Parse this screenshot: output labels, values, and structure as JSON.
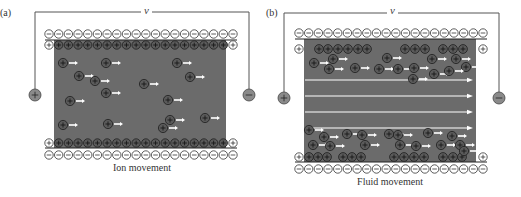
{
  "colors": {
    "channel": "#6b6b6b",
    "ion_fill": "#5a5a5a",
    "ion_stroke": "#1e1e1e",
    "counter_ion_fill": "#ffffff",
    "wire": "#555555",
    "arrow": "#ffffff",
    "electrode_fill": "#8a8a8a"
  },
  "panels": [
    {
      "id": "a",
      "label": "(a)",
      "voltage_label": "v",
      "caption": "Ion movement",
      "left_electrode_sign": "+",
      "right_electrode_sign": "−",
      "wall_negative_charges_per_row": 20,
      "wall_positive_charges_per_row": 20,
      "mobile_ions": [
        [
          63,
          63
        ],
        [
          79,
          76
        ],
        [
          106,
          63
        ],
        [
          106,
          93
        ],
        [
          70,
          101
        ],
        [
          95,
          81
        ],
        [
          144,
          84
        ],
        [
          177,
          63
        ],
        [
          190,
          77
        ],
        [
          168,
          100
        ],
        [
          170,
          120
        ],
        [
          63,
          125
        ],
        [
          108,
          124
        ],
        [
          163,
          128
        ],
        [
          205,
          118
        ]
      ],
      "flow_arrows": []
    },
    {
      "id": "b",
      "label": "(b)",
      "voltage_label": "v",
      "caption": "Fluid movement",
      "left_electrode_sign": "+",
      "right_electrode_sign": "−",
      "wall_negative_charges_per_row": 20,
      "top_layer_ions": [
        [
          319,
          49
        ],
        [
          328,
          49
        ],
        [
          338,
          49
        ],
        [
          348,
          49
        ],
        [
          358,
          49
        ],
        [
          367,
          49
        ],
        [
          405,
          49
        ],
        [
          415,
          49
        ],
        [
          425,
          49
        ],
        [
          443,
          49
        ],
        [
          453,
          49
        ],
        [
          463,
          49
        ]
      ],
      "bottom_layer_ions": [
        [
          309,
          157
        ],
        [
          318,
          157
        ],
        [
          327,
          157
        ],
        [
          343,
          157
        ],
        [
          352,
          157
        ],
        [
          361,
          157
        ],
        [
          394,
          157
        ],
        [
          404,
          157
        ],
        [
          414,
          157
        ],
        [
          424,
          157
        ],
        [
          443,
          157
        ],
        [
          453,
          157
        ],
        [
          462,
          157
        ]
      ],
      "mobile_ions": [
        [
          314,
          63
        ],
        [
          333,
          59
        ],
        [
          329,
          69
        ],
        [
          355,
          68
        ],
        [
          379,
          69
        ],
        [
          387,
          58
        ],
        [
          398,
          69
        ],
        [
          414,
          68
        ],
        [
          413,
          79
        ],
        [
          432,
          59
        ],
        [
          434,
          74
        ],
        [
          456,
          59
        ],
        [
          466,
          67
        ],
        [
          449,
          71
        ],
        [
          309,
          130
        ],
        [
          324,
          137
        ],
        [
          313,
          145
        ],
        [
          330,
          146
        ],
        [
          347,
          134
        ],
        [
          362,
          135
        ],
        [
          365,
          145
        ],
        [
          389,
          134
        ],
        [
          398,
          135
        ],
        [
          400,
          145
        ],
        [
          416,
          146
        ],
        [
          428,
          133
        ],
        [
          441,
          145
        ],
        [
          452,
          136
        ],
        [
          460,
          145
        ],
        [
          464,
          151
        ]
      ],
      "flow_arrows": [
        80,
        96,
        112,
        128
      ]
    }
  ]
}
